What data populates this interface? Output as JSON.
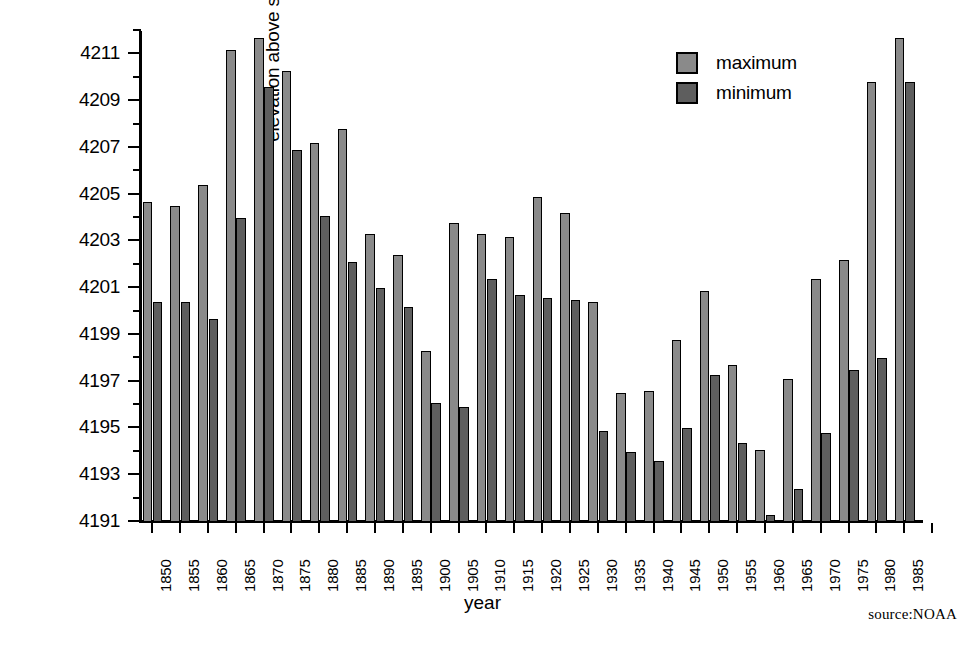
{
  "chart_data": {
    "type": "bar",
    "title": "",
    "xlabel": "year",
    "ylabel": "elevation above sealevel (feet)",
    "ylim": [
      4191,
      4212
    ],
    "ytick_step": 2,
    "yminor_step": 1,
    "grid": false,
    "legend_position": "top-right",
    "axis_note": "y axis truncated; bars drawn from 4191 baseline",
    "categories": [
      "1850",
      "1855",
      "1860",
      "1865",
      "1870",
      "1875",
      "1880",
      "1885",
      "1890",
      "1895",
      "1900",
      "1905",
      "1910",
      "1915",
      "1920",
      "1925",
      "1930",
      "1935",
      "1940",
      "1945",
      "1950",
      "1955",
      "1960",
      "1965",
      "1970",
      "1975",
      "1980",
      "1985"
    ],
    "yticks": [
      4191,
      4193,
      4195,
      4197,
      4199,
      4201,
      4203,
      4205,
      4207,
      4209,
      4211
    ],
    "series": [
      {
        "name": "maximum",
        "color": "#8a8a8a",
        "values": [
          4204.7,
          4204.5,
          4205.4,
          4211.2,
          4211.7,
          4210.3,
          4207.2,
          4207.8,
          4203.3,
          4202.4,
          4198.3,
          4203.8,
          4203.3,
          4203.2,
          4204.9,
          4204.2,
          4200.4,
          4196.5,
          4196.6,
          4198.8,
          4200.9,
          4197.7,
          4194.1,
          4197.1,
          4201.4,
          4202.2,
          4209.8,
          4211.7
        ]
      },
      {
        "name": "minimum",
        "color": "#5e5e5e",
        "values": [
          4200.4,
          4200.4,
          4199.7,
          4204.0,
          4209.6,
          4206.9,
          4204.1,
          4202.1,
          4201.0,
          4200.2,
          4196.1,
          4195.9,
          4201.4,
          4200.7,
          4200.6,
          4200.5,
          4194.9,
          4194.0,
          4193.6,
          4195.0,
          4197.3,
          4194.4,
          4191.3,
          4192.4,
          4194.8,
          4197.5,
          4198.0,
          4209.8
        ]
      }
    ]
  },
  "legend": {
    "items": [
      {
        "label": "maximum",
        "swatch": "max"
      },
      {
        "label": "minimum",
        "swatch": "min"
      }
    ]
  },
  "source_note": "source:NOAA"
}
